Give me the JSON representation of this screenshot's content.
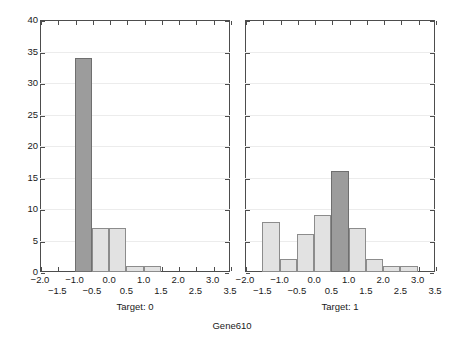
{
  "chart_data": {
    "type": "bar",
    "title": "Gene610",
    "xlabel": "",
    "ylabel": "No of obs",
    "ylim": [
      0,
      40
    ],
    "ytick_step": 5,
    "yticks": [
      0,
      5,
      10,
      15,
      20,
      25,
      30,
      35,
      40
    ],
    "xlim": [
      -2.0,
      3.5
    ],
    "xticks": [
      -2.0,
      -1.5,
      -1.0,
      -0.5,
      0.0,
      0.5,
      1.0,
      1.5,
      2.0,
      2.5,
      3.0,
      3.5
    ],
    "xticklabels": [
      "-2.0",
      "-1.5",
      "-1.0",
      "-0.5",
      "0.0",
      "0.5",
      "1.0",
      "1.5",
      "2.0",
      "2.5",
      "3.0",
      "3.5"
    ],
    "bin_width": 0.5,
    "grid": "horizontal",
    "legend": "none",
    "panels": [
      {
        "caption": "Target: 0",
        "bins": [
          {
            "x0": -1.0,
            "x1": -0.5,
            "count": 34,
            "highlight": true
          },
          {
            "x0": -0.5,
            "x1": 0.0,
            "count": 7,
            "highlight": false
          },
          {
            "x0": 0.0,
            "x1": 0.5,
            "count": 7,
            "highlight": false
          },
          {
            "x0": 0.5,
            "x1": 1.0,
            "count": 1,
            "highlight": false
          },
          {
            "x0": 1.0,
            "x1": 1.5,
            "count": 1,
            "highlight": false
          }
        ]
      },
      {
        "caption": "Target: 1",
        "bins": [
          {
            "x0": -1.5,
            "x1": -1.0,
            "count": 8,
            "highlight": false
          },
          {
            "x0": -1.0,
            "x1": -0.5,
            "count": 2,
            "highlight": false
          },
          {
            "x0": -0.5,
            "x1": 0.0,
            "count": 6,
            "highlight": false
          },
          {
            "x0": 0.0,
            "x1": 0.5,
            "count": 9,
            "highlight": false
          },
          {
            "x0": 0.5,
            "x1": 1.0,
            "count": 16,
            "highlight": true
          },
          {
            "x0": 1.0,
            "x1": 1.5,
            "count": 7,
            "highlight": false
          },
          {
            "x0": 1.5,
            "x1": 2.0,
            "count": 2,
            "highlight": false
          },
          {
            "x0": 2.0,
            "x1": 2.5,
            "count": 1,
            "highlight": false
          },
          {
            "x0": 2.5,
            "x1": 3.0,
            "count": 1,
            "highlight": false
          }
        ]
      }
    ],
    "colors": {
      "bar_fill": "#e2e2e2",
      "bar_edge": "#8c8c8c",
      "bar_fill_highlight": "#9c9c9c",
      "bar_edge_highlight": "#6f6f6f",
      "axis": "#4d4d4d",
      "grid": "#ececec",
      "background": "#ffffff",
      "text": "#1a1a1a"
    }
  }
}
